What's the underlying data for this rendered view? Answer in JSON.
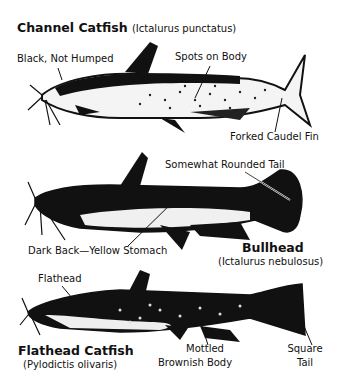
{
  "species": [
    {
      "common_name": "Channel Catfish",
      "scientific_name": "(Ictalurus punctatus)",
      "labels": [
        "Black, Not Humped",
        "Spots on Body",
        "Forked Caudel Fin"
      ]
    },
    {
      "common_name": "Bullhead",
      "scientific_name": "(Ictalurus nebulosus)",
      "labels": [
        "Somewhat Rounded Tail",
        "Dark Back—Yellow Stomach"
      ]
    },
    {
      "common_name": "Flathead Catfish",
      "scientific_name": "(Pylodictis olivaris)",
      "labels": [
        "Flathead",
        "Mottled",
        "Brownish Body",
        "Square",
        "Tail"
      ]
    }
  ]
}
